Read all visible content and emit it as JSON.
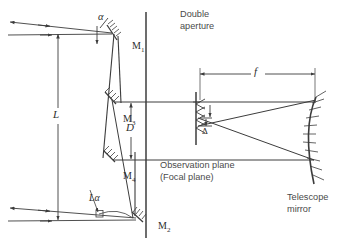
{
  "figure": {
    "type": "optical-ray-diagram",
    "background": "#ffffff",
    "stroke_color": "#3c3c3c",
    "text_color": "#4a4a4a",
    "width": 354,
    "height": 252
  },
  "labels": {
    "alpha": "α",
    "m1": "M",
    "m1_sub": "1",
    "m2": "M",
    "m2_sub": "2",
    "m3": "M",
    "m3_sub": "3",
    "m4": "M",
    "m4_sub": "4",
    "L": "L",
    "L_alpha": "Lα",
    "D": "D",
    "f": "f",
    "delta": "Δ",
    "double_aperture_line1": "Double",
    "double_aperture_line2": "aperture",
    "observation_line1": "Observation plane",
    "observation_line2": "(Focal plane)",
    "telescope_line1": "Telescope",
    "telescope_line2": "mirror"
  },
  "elements": {
    "mirrors": [
      {
        "name": "M1",
        "label": "M₁",
        "role": "top steering mirror"
      },
      {
        "name": "M2",
        "label": "M₂",
        "role": "bottom steering mirror"
      },
      {
        "name": "M3",
        "label": "M₃",
        "role": "upper fold mirror"
      },
      {
        "name": "M4",
        "label": "M₄",
        "role": "lower fold mirror"
      },
      {
        "name": "telescope-mirror",
        "label": "Telescope mirror",
        "role": "concave focusing mirror"
      }
    ],
    "planes": [
      {
        "name": "double-aperture",
        "label": "Double aperture",
        "orientation": "vertical"
      },
      {
        "name": "observation-plane",
        "label": "Observation plane (Focal plane)",
        "orientation": "vertical"
      }
    ],
    "dimensions": [
      {
        "name": "L",
        "label": "L",
        "orientation": "vertical",
        "between": "M1 baseline to M2 baseline"
      },
      {
        "name": "D",
        "label": "D",
        "orientation": "vertical",
        "between": "M3 beam to M4 beam"
      },
      {
        "name": "f",
        "label": "f",
        "orientation": "horizontal",
        "between": "focal plane to telescope mirror"
      },
      {
        "name": "L-alpha",
        "label": "Lα",
        "orientation": "along lower beam"
      },
      {
        "name": "delta",
        "label": "Δ",
        "orientation": "vertical",
        "between": "two focal spots"
      }
    ],
    "angles": [
      {
        "name": "alpha",
        "label": "α",
        "at": "M1 incoming beams"
      }
    ]
  }
}
